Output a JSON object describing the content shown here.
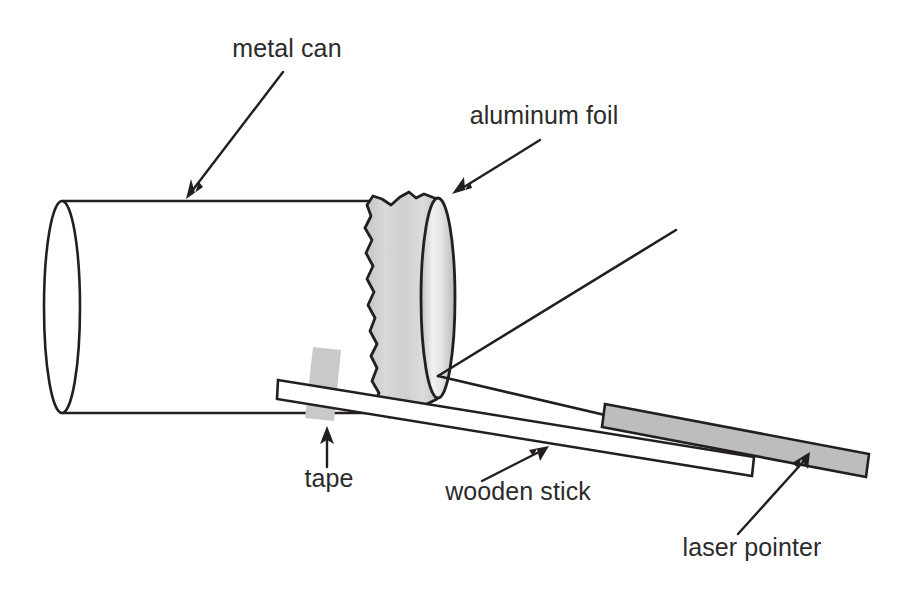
{
  "figure": {
    "background_color": "#ffffff",
    "stroke_color": "#231f20",
    "label_color": "#2b2b2b",
    "width": 914,
    "height": 602
  },
  "labels": {
    "metal_can": "metal can",
    "aluminum_foil": "aluminum foil",
    "tape": "tape",
    "wooden_stick": "wooden stick",
    "laser_pointer": "laser pointer"
  },
  "parts": [
    {
      "id": "metal-can",
      "label": "metal can",
      "fill": "#ffffff",
      "outline": "#231f20",
      "shape": "open cylinder seen from the side, open end at left"
    },
    {
      "id": "aluminum-foil",
      "label": "aluminum foil",
      "fill": "#d2d2d2",
      "outline": "#231f20",
      "shape": "wrinkled foil band wrapped over the right end of the can with an elliptical front face"
    },
    {
      "id": "tape",
      "label": "tape",
      "fill": "#c9c9c9",
      "outline": "none",
      "shape": "small slanted gray strip holding the stick to the can"
    },
    {
      "id": "wooden-stick",
      "label": "wooden stick",
      "fill": "#ffffff",
      "outline": "#231f20",
      "shape": "long thin outlined bar sloping down to the right"
    },
    {
      "id": "laser-pointer",
      "label": "laser pointer",
      "fill": "#bdbdbd",
      "outline": "#231f20",
      "shape": "gray filled bar resting on the stick at the lower right"
    },
    {
      "id": "laser-beam",
      "label": "laser beam",
      "outline": "#231f20",
      "shape": "incident ray to the foil and reflected ray going up to the right"
    }
  ],
  "annotations": [
    {
      "name": "metal-can-annotation",
      "text": "metal can",
      "text_anchor": "middle",
      "text_x": 287,
      "text_y": 57,
      "arrow_from": [
        283,
        72
      ],
      "arrow_to": [
        186,
        196
      ],
      "arrow_direction": "down-left"
    },
    {
      "name": "aluminum-foil-annotation",
      "text": "aluminum foil",
      "text_anchor": "middle",
      "text_x": 544,
      "text_y": 124,
      "arrow_from": [
        540,
        140
      ],
      "arrow_to": [
        452,
        192
      ],
      "arrow_direction": "down-left"
    },
    {
      "name": "tape-annotation",
      "text": "tape",
      "text_anchor": "middle",
      "text_x": 329,
      "text_y": 487,
      "arrow_from": [
        327,
        467
      ],
      "arrow_to": [
        327,
        428
      ],
      "arrow_direction": "up"
    },
    {
      "name": "wooden-stick-annotation",
      "text": "wooden stick",
      "text_anchor": "middle",
      "text_x": 518,
      "text_y": 500,
      "arrow_from": [
        482,
        481
      ],
      "arrow_to": [
        545,
        447
      ],
      "arrow_direction": "up-right"
    },
    {
      "name": "laser-pointer-annotation",
      "text": "laser pointer",
      "text_anchor": "middle",
      "text_x": 752,
      "text_y": 556,
      "arrow_from": [
        738,
        534
      ],
      "arrow_to": [
        808,
        455
      ],
      "arrow_direction": "up-right"
    }
  ],
  "beam": {
    "hit_point": [
      438,
      376
    ],
    "incident_start": [
      742,
      447
    ],
    "reflected_end": [
      676,
      230
    ]
  }
}
